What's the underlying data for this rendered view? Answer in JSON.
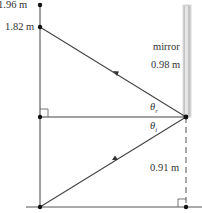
{
  "diagram": {
    "labels": {
      "top_height": "1.96 m",
      "eye_height": "1.82 m",
      "mirror": "mirror",
      "mirror_length": "0.98 m",
      "theta_r": "θ",
      "theta_r_sub": "r",
      "theta_i": "θ",
      "theta_i_sub": "i",
      "mirror_bottom_height": "0.91 m"
    },
    "colors": {
      "line": "#333333",
      "mirror_fill": "#c8c8c8",
      "mirror_edge": "#e8e8e8"
    }
  }
}
